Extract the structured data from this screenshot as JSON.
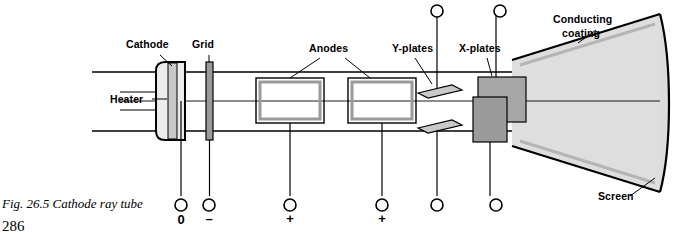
{
  "figure": {
    "caption": "Fig. 26.5 Cathode ray tube",
    "page_number": "286"
  },
  "labels": {
    "cathode": "Cathode",
    "grid": "Grid",
    "anodes": "Anodes",
    "y_plates": "Y-plates",
    "x_plates": "X-plates",
    "conducting_coating_line1": "Conducting",
    "conducting_coating_line2": "coating",
    "heater": "Heater",
    "screen": "Screen"
  },
  "terminals": {
    "heater_zero": "0",
    "grid_minus": "–",
    "anode1_plus": "+",
    "anode2_plus": "+"
  },
  "colors": {
    "outline": "#000000",
    "fill_light": "#d8d8d8",
    "fill_mid": "#a9a9a9",
    "fill_cone": "#dcdcdc",
    "background": "#ffffff"
  }
}
